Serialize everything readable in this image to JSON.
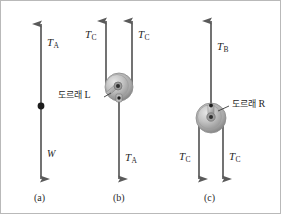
{
  "figure": {
    "background_color": "#ffffff",
    "border_color": "#b9b9b9",
    "arrow_color": "#5a5a5a",
    "pulley_color": "#b3b3b3",
    "text_color": "#262626"
  },
  "panels": [
    {
      "id": "a",
      "caption": "(a)",
      "labels": {
        "up_force": "T",
        "up_force_sub": "A",
        "down_force": "W"
      },
      "has_pulley": false,
      "node_dot": true
    },
    {
      "id": "b",
      "caption": "(b)",
      "labels": {
        "up_force_left": "T",
        "up_force_left_sub": "C",
        "up_force_right": "T",
        "up_force_right_sub": "C",
        "down_force": "T",
        "down_force_sub": "A",
        "pulley_name": "도르래",
        "pulley_id": "L"
      },
      "has_pulley": true
    },
    {
      "id": "c",
      "caption": "(c)",
      "labels": {
        "up_force": "T",
        "up_force_sub": "B",
        "down_force_left": "T",
        "down_force_left_sub": "C",
        "down_force_right": "T",
        "down_force_right_sub": "C",
        "pulley_name": "도르래",
        "pulley_id": "R"
      },
      "has_pulley": true
    }
  ],
  "diagram_data": {
    "type": "free-body-diagram",
    "vectors": [
      {
        "panel": "a",
        "label": "T_A",
        "direction": "up",
        "x": 40
      },
      {
        "panel": "a",
        "label": "W",
        "direction": "down",
        "x": 40
      },
      {
        "panel": "b",
        "label": "T_C",
        "direction": "up",
        "x": 105
      },
      {
        "panel": "b",
        "label": "T_C",
        "direction": "up",
        "x": 131
      },
      {
        "panel": "b",
        "label": "T_A",
        "direction": "down",
        "x": 118
      },
      {
        "panel": "c",
        "label": "T_B",
        "direction": "up",
        "x": 210
      },
      {
        "panel": "c",
        "label": "T_C",
        "direction": "down",
        "x": 198
      },
      {
        "panel": "c",
        "label": "T_C",
        "direction": "down",
        "x": 222
      }
    ],
    "pulleys": [
      {
        "panel": "b",
        "name": "도르래 L",
        "cx": 118,
        "cy": 86,
        "r": 14
      },
      {
        "panel": "c",
        "name": "도르래 R",
        "cx": 210,
        "cy": 116,
        "r": 15
      }
    ]
  }
}
